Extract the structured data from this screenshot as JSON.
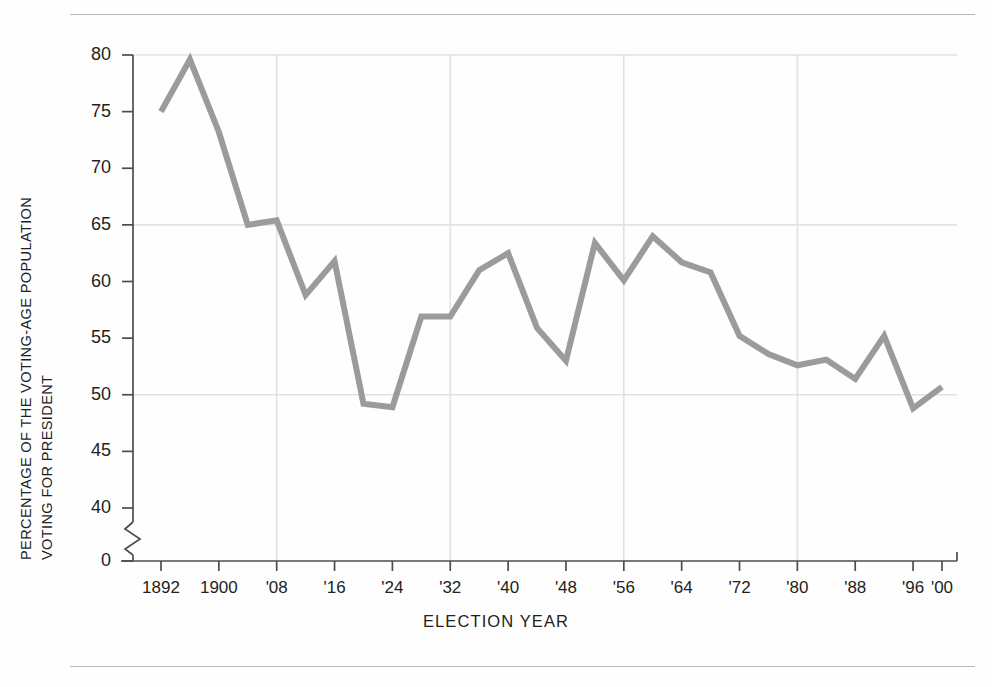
{
  "chart_data": {
    "type": "line",
    "title": "",
    "xlabel": "ELECTION  YEAR",
    "ylabel": "PERCENTAGE OF THE VOTING-AGE POPULATION VOTING FOR PRESIDENT",
    "ylabel_lines": [
      "PERCENTAGE OF THE VOTING-AGE POPULATION",
      "VOTING FOR PRESIDENT"
    ],
    "ylim": [
      40,
      80
    ],
    "y_axis_break": true,
    "y_break_baseline": 0,
    "yticks": [
      80,
      75,
      70,
      65,
      60,
      55,
      50,
      45,
      40,
      0
    ],
    "ytick_labels": [
      "80",
      "75",
      "70",
      "65",
      "60",
      "55",
      "50",
      "45",
      "40",
      "0"
    ],
    "gridlines_y": [
      80,
      65,
      50
    ],
    "gridlines_x": [
      1908,
      1932,
      1956,
      1980
    ],
    "grid": true,
    "legend": "none",
    "line_color": "#9b9b9b",
    "line_width": 6,
    "xtick_years": [
      1892,
      1900,
      1908,
      1916,
      1924,
      1932,
      1940,
      1948,
      1956,
      1964,
      1972,
      1980,
      1988,
      1996,
      2000
    ],
    "xtick_labels": [
      "1892",
      "1900",
      "'08",
      "'16",
      "'24",
      "'32",
      "'40",
      "'48",
      "'56",
      "'64",
      "'72",
      "'80",
      "'88",
      "'96",
      "'00"
    ],
    "x": [
      1892,
      1896,
      1900,
      1904,
      1908,
      1912,
      1916,
      1920,
      1924,
      1928,
      1932,
      1936,
      1940,
      1944,
      1948,
      1952,
      1956,
      1960,
      1964,
      1968,
      1972,
      1976,
      1980,
      1984,
      1988,
      1992,
      1996,
      2000
    ],
    "values": [
      75.0,
      79.6,
      73.2,
      65.0,
      65.4,
      58.8,
      61.8,
      49.2,
      48.9,
      56.9,
      56.9,
      61.0,
      62.5,
      55.9,
      53.0,
      63.4,
      60.1,
      64.0,
      61.7,
      60.8,
      55.2,
      53.6,
      52.6,
      53.1,
      51.4,
      55.2,
      48.8,
      50.7
    ],
    "xlim": [
      1890,
      2002
    ]
  }
}
